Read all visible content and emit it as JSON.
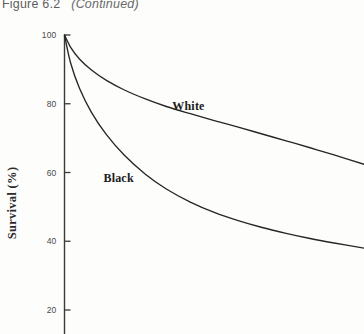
{
  "figure": {
    "number": "Figure 6.2",
    "continued": "(Continued)"
  },
  "axes": {
    "y_title": "Survival (%)",
    "y_ticks": [
      {
        "label": "100",
        "value": 100
      },
      {
        "label": "80",
        "value": 80
      },
      {
        "label": "60",
        "value": 60
      },
      {
        "label": "40",
        "value": 40
      },
      {
        "label": "20",
        "value": 20
      }
    ]
  },
  "annotations": {
    "white_label": "White",
    "black_label": "Black"
  },
  "colors": {
    "page_background": "#fdfdfc",
    "axis_line": "#3a3a3a",
    "curve_line": "#262626",
    "tick_text": "#4a4a4a",
    "caption_text": "#5d5d5d",
    "label_text": "#1b1b1b"
  },
  "chart_data": {
    "type": "line",
    "xlabel": "",
    "ylabel": "Survival (%)",
    "ylim": [
      20,
      100
    ],
    "xlim": [
      0,
      100
    ],
    "grid": false,
    "legend": "inline-annotations",
    "y_ticks": [
      20,
      40,
      60,
      80,
      100
    ],
    "series": [
      {
        "name": "White",
        "label_position": {
          "x": 38,
          "y": 79
        },
        "points": [
          {
            "x": 0,
            "y": 100.0
          },
          {
            "x": 2,
            "y": 96.5
          },
          {
            "x": 5,
            "y": 93.0
          },
          {
            "x": 9,
            "y": 89.8
          },
          {
            "x": 14,
            "y": 86.8
          },
          {
            "x": 20,
            "y": 84.0
          },
          {
            "x": 27,
            "y": 81.4
          },
          {
            "x": 34,
            "y": 79.2
          },
          {
            "x": 42,
            "y": 77.1
          },
          {
            "x": 50,
            "y": 75.1
          },
          {
            "x": 58,
            "y": 73.2
          },
          {
            "x": 66,
            "y": 71.2
          },
          {
            "x": 74,
            "y": 69.2
          },
          {
            "x": 82,
            "y": 67.2
          },
          {
            "x": 90,
            "y": 65.1
          },
          {
            "x": 100,
            "y": 62.4
          }
        ]
      },
      {
        "name": "Black",
        "label_position": {
          "x": 15,
          "y": 58
        },
        "points": [
          {
            "x": 0,
            "y": 100.0
          },
          {
            "x": 2,
            "y": 92.0
          },
          {
            "x": 5,
            "y": 84.5
          },
          {
            "x": 9,
            "y": 77.5
          },
          {
            "x": 14,
            "y": 71.0
          },
          {
            "x": 20,
            "y": 65.0
          },
          {
            "x": 27,
            "y": 59.5
          },
          {
            "x": 34,
            "y": 55.2
          },
          {
            "x": 42,
            "y": 51.4
          },
          {
            "x": 50,
            "y": 48.4
          },
          {
            "x": 58,
            "y": 46.0
          },
          {
            "x": 66,
            "y": 44.0
          },
          {
            "x": 74,
            "y": 42.3
          },
          {
            "x": 82,
            "y": 40.8
          },
          {
            "x": 90,
            "y": 39.5
          },
          {
            "x": 100,
            "y": 38.0
          }
        ]
      }
    ]
  },
  "geometry": {
    "axis_x_px": 64.5,
    "axis_top_px": 35,
    "axis_bottom_px": 334,
    "plot_right_px": 364,
    "y_100_px": 35,
    "y_20_px": 310,
    "tick_len_px": 6
  }
}
